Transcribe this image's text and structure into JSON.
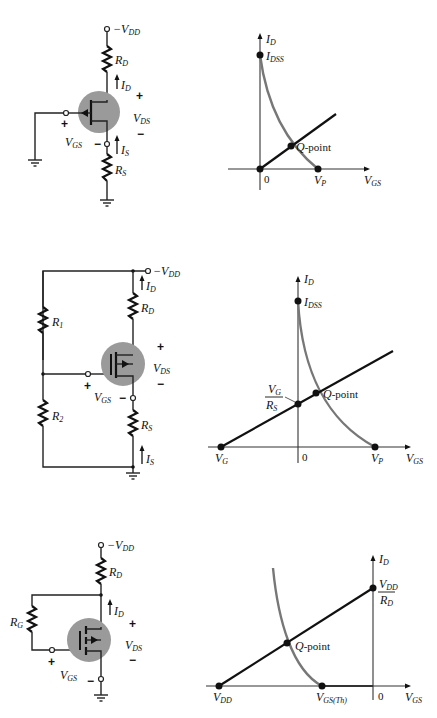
{
  "figure": {
    "colors": {
      "transistor_fill": "#9a9a9a",
      "transfer_curve": "#777777",
      "load_line": "#111111"
    },
    "panels": [
      {
        "circuit": {
          "type": "p-channel JFET self-bias",
          "supply": "−V",
          "supply_sub": "DD",
          "rd": "R",
          "rd_sub": "D",
          "rs": "R",
          "rs_sub": "S",
          "id": "I",
          "id_sub": "D",
          "is": "I",
          "is_sub": "S",
          "vds": "V",
          "vds_sub": "DS",
          "vgs": "V",
          "vgs_sub": "GS",
          "plus": "+",
          "minus": "−"
        },
        "graph": {
          "y_axis": "I",
          "y_axis_sub": "D",
          "x_axis": "V",
          "x_axis_sub": "GS",
          "idss": "I",
          "idss_sub": "DSS",
          "origin": "0",
          "vp": "V",
          "vp_sub": "P",
          "qpoint": "Q",
          "qpoint_suffix": "-point"
        }
      },
      {
        "circuit": {
          "type": "p-channel depletion MOSFET voltage-divider bias",
          "supply": "−V",
          "supply_sub": "DD",
          "r1": "R",
          "r1_sub": "1",
          "r2": "R",
          "r2_sub": "2",
          "rd": "R",
          "rd_sub": "D",
          "rs": "R",
          "rs_sub": "S",
          "id": "I",
          "id_sub": "D",
          "is": "I",
          "is_sub": "S",
          "vds": "V",
          "vds_sub": "DS",
          "vgs": "V",
          "vgs_sub": "GS",
          "plus": "+",
          "minus": "−"
        },
        "graph": {
          "y_axis": "I",
          "y_axis_sub": "D",
          "x_axis": "V",
          "x_axis_sub": "GS",
          "idss": "I",
          "idss_sub": "DSS",
          "origin": "0",
          "vp": "V",
          "vp_sub": "P",
          "vg": "V",
          "vg_sub": "G",
          "intercept_num": "V",
          "intercept_num_sub": "G",
          "intercept_den": "R",
          "intercept_den_sub": "S",
          "qpoint": "Q",
          "qpoint_suffix": "-point"
        }
      },
      {
        "circuit": {
          "type": "p-channel enhancement MOSFET feedback bias",
          "supply": "−V",
          "supply_sub": "DD",
          "rg": "R",
          "rg_sub": "G",
          "rd": "R",
          "rd_sub": "D",
          "id": "I",
          "id_sub": "D",
          "vds": "V",
          "vds_sub": "DS",
          "vgs": "V",
          "vgs_sub": "GS",
          "plus": "+",
          "minus": "−"
        },
        "graph": {
          "y_axis": "I",
          "y_axis_sub": "D",
          "x_axis": "V",
          "x_axis_sub": "GS",
          "origin": "0",
          "vdd": "V",
          "vdd_sub": "DD",
          "vth": "V",
          "vth_sub": "GS(Th)",
          "intercept_num": "V",
          "intercept_num_sub": "DD",
          "intercept_den": "R",
          "intercept_den_sub": "D",
          "qpoint": "Q",
          "qpoint_suffix": "-point"
        }
      }
    ]
  }
}
